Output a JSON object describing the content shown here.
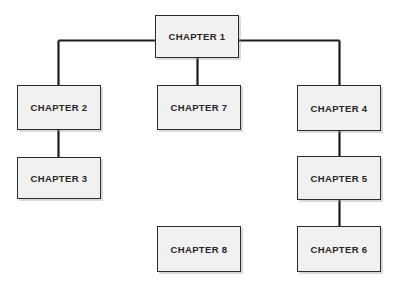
{
  "diagram": {
    "type": "hierarchy-tree",
    "canvas": {
      "width": 398,
      "height": 288,
      "background": "#ffffff"
    },
    "style": {
      "node_fill": "#f1f1f1",
      "node_border": "#2b2b2b",
      "edge_color": "#1c1c1c",
      "text_color": "#262626"
    },
    "nodes": [
      {
        "id": "ch1",
        "label": "CHAPTER 1",
        "x": 155,
        "y": 15,
        "w": 84,
        "h": 43
      },
      {
        "id": "ch2",
        "label": "CHAPTER 2",
        "x": 17,
        "y": 85,
        "w": 84,
        "h": 45
      },
      {
        "id": "ch3",
        "label": "CHAPTER 3",
        "x": 17,
        "y": 157,
        "w": 84,
        "h": 42
      },
      {
        "id": "ch7",
        "label": "CHAPTER 7",
        "x": 157,
        "y": 85,
        "w": 84,
        "h": 45
      },
      {
        "id": "ch4",
        "label": "CHAPTER 4",
        "x": 297,
        "y": 85,
        "w": 84,
        "h": 46
      },
      {
        "id": "ch5",
        "label": "CHAPTER 5",
        "x": 297,
        "y": 156,
        "w": 84,
        "h": 44
      },
      {
        "id": "ch6",
        "label": "CHAPTER 6",
        "x": 297,
        "y": 226,
        "w": 84,
        "h": 46
      },
      {
        "id": "ch8",
        "label": "CHAPTER 8",
        "x": 157,
        "y": 226,
        "w": 84,
        "h": 46
      }
    ],
    "edges": [
      {
        "id": "e-ch1-ch2",
        "from": "ch1",
        "to": "ch2",
        "kind": "elbow-left"
      },
      {
        "id": "e-ch1-ch7",
        "from": "ch1",
        "to": "ch7",
        "kind": "straight-down"
      },
      {
        "id": "e-ch1-ch4",
        "from": "ch1",
        "to": "ch4",
        "kind": "elbow-right"
      },
      {
        "id": "e-ch2-ch3",
        "from": "ch2",
        "to": "ch3",
        "kind": "straight-down"
      },
      {
        "id": "e-ch4-ch5",
        "from": "ch4",
        "to": "ch5",
        "kind": "straight-down"
      },
      {
        "id": "e-ch5-ch6",
        "from": "ch5",
        "to": "ch6",
        "kind": "straight-down"
      }
    ],
    "unconnected_nodes": [
      "ch8"
    ]
  }
}
